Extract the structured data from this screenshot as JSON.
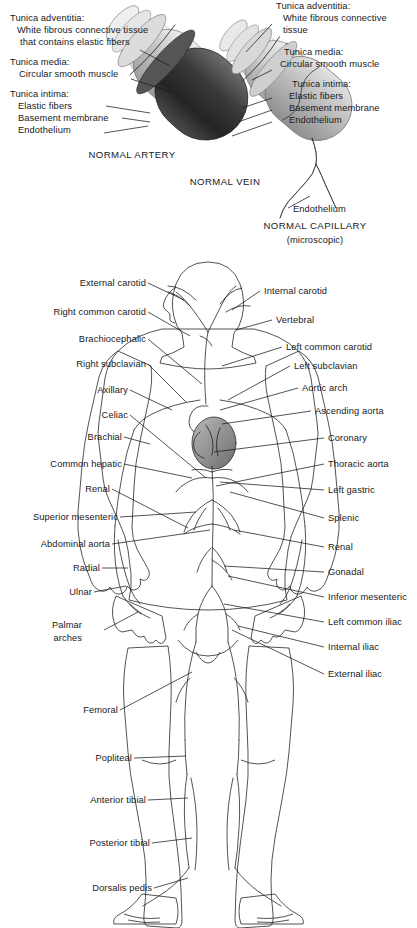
{
  "diagram": {
    "vessel_panel": {
      "artery": {
        "caption": "NORMAL ARTERY",
        "labels": [
          {
            "id": "tunica-adventitia",
            "lines": [
              "Tunica adventitia:",
              "White fibrous connective tissue",
              "that contains elastic fibers"
            ]
          },
          {
            "id": "tunica-media",
            "lines": [
              "Tunica media:",
              "Circular smooth muscle"
            ]
          },
          {
            "id": "tunica-intima",
            "lines": [
              "Tunica intima:"
            ]
          },
          {
            "id": "elastic-fibers",
            "lines": [
              "Elastic fibers"
            ]
          },
          {
            "id": "basement-membrane",
            "lines": [
              "Basement membrane"
            ]
          },
          {
            "id": "endothelium",
            "lines": [
              "Endothelium"
            ]
          }
        ]
      },
      "vein": {
        "caption": "NORMAL VEIN",
        "labels": [
          {
            "id": "tunica-adventitia",
            "lines": [
              "Tunica adventitia:",
              "White fibrous connective",
              "tissue"
            ]
          },
          {
            "id": "tunica-media",
            "lines": [
              "Tunica media:",
              "Circular smooth muscle"
            ]
          },
          {
            "id": "tunica-intima",
            "lines": [
              "Tunica intima:"
            ]
          },
          {
            "id": "elastic-fibers",
            "lines": [
              "Elastic fibers"
            ]
          },
          {
            "id": "basement-membrane",
            "lines": [
              "Basement membrane"
            ]
          },
          {
            "id": "endothelium",
            "lines": [
              "Endothelium"
            ]
          }
        ]
      },
      "capillary": {
        "caption": "NORMAL CAPILLARY",
        "subcaption": "(microscopic)",
        "labels": [
          {
            "id": "endothelium",
            "lines": [
              "Endothelium"
            ]
          }
        ]
      },
      "text": {
        "artery_adventitia_l1": "Tunica adventitia:",
        "artery_adventitia_l2": "White fibrous connective tissue",
        "artery_adventitia_l3": "that contains elastic fibers",
        "artery_media_l1": "Tunica media:",
        "artery_media_l2": "Circular smooth muscle",
        "artery_intima_l1": "Tunica intima:",
        "artery_elastic": "Elastic fibers",
        "artery_basement": "Basement membrane",
        "artery_endothelium": "Endothelium",
        "artery_caption": "NORMAL ARTERY",
        "vein_adventitia_l1": "Tunica adventitia:",
        "vein_adventitia_l2": "White fibrous connective",
        "vein_adventitia_l3": "tissue",
        "vein_media_l1": "Tunica media:",
        "vein_media_l2": "Circular smooth muscle",
        "vein_intima_l1": "Tunica intima:",
        "vein_elastic": "Elastic fibers",
        "vein_basement": "Basement membrane",
        "vein_endothelium": "Endothelium",
        "vein_caption": "NORMAL VEIN",
        "cap_endothelium": "Endothelium",
        "cap_caption": "NORMAL CAPILLARY",
        "cap_sub": "(microscopic)"
      }
    },
    "body_labels_left": [
      {
        "id": "external-carotid",
        "text": "External carotid",
        "x": 146,
        "y": 283
      },
      {
        "id": "right-common-carotid",
        "text": "Right common carotid",
        "x": 146,
        "y": 312
      },
      {
        "id": "brachiocephalic",
        "text": "Brachiocephalic",
        "x": 146,
        "y": 339
      },
      {
        "id": "right-subclavian",
        "text": "Right subclavian",
        "x": 146,
        "y": 364
      },
      {
        "id": "axillary",
        "text": "Axillary",
        "x": 128,
        "y": 390
      },
      {
        "id": "celiac",
        "text": "Celiac",
        "x": 128,
        "y": 415
      },
      {
        "id": "brachial",
        "text": "Brachial",
        "x": 122,
        "y": 437
      },
      {
        "id": "common-hepatic",
        "text": "Common hepatic",
        "x": 122,
        "y": 464
      },
      {
        "id": "renal-left",
        "text": "Renal",
        "x": 110,
        "y": 489
      },
      {
        "id": "superior-mesenteric",
        "text": "Superior mesenteric",
        "x": 118,
        "y": 517
      },
      {
        "id": "abdominal-aorta",
        "text": "Abdominal aorta",
        "x": 110,
        "y": 544
      },
      {
        "id": "radial",
        "text": "Radial",
        "x": 100,
        "y": 568
      },
      {
        "id": "ulnar",
        "text": "Ulnar",
        "x": 92,
        "y": 592
      },
      {
        "id": "femoral",
        "text": "Femoral",
        "x": 118,
        "y": 710
      },
      {
        "id": "popliteal",
        "text": "Popliteal",
        "x": 132,
        "y": 758
      },
      {
        "id": "anterior-tibial",
        "text": "Anterior tibial",
        "x": 146,
        "y": 800
      },
      {
        "id": "posterior-tibial",
        "text": "Posterior tibial",
        "x": 150,
        "y": 843
      },
      {
        "id": "dorsalis-pedis",
        "text": "Dorsalis pedis",
        "x": 152,
        "y": 888
      }
    ],
    "body_label_palmar": {
      "id": "palmar-arches",
      "line1": "Palmar",
      "line2": "arches",
      "x": 83,
      "y": 625
    },
    "body_labels_right": [
      {
        "id": "internal-carotid",
        "text": "Internal carotid",
        "x": 262,
        "y": 291
      },
      {
        "id": "vertebral",
        "text": "Vertebral",
        "x": 274,
        "y": 320
      },
      {
        "id": "left-common-carotid",
        "text": "Left common carotid",
        "x": 284,
        "y": 347
      },
      {
        "id": "left-subclavian",
        "text": "Left subclavian",
        "x": 292,
        "y": 366
      },
      {
        "id": "aortic-arch",
        "text": "Aortic arch",
        "x": 300,
        "y": 388
      },
      {
        "id": "ascending-aorta",
        "text": "Ascending aorta",
        "x": 313,
        "y": 411
      },
      {
        "id": "coronary",
        "text": "Coronary",
        "x": 326,
        "y": 438
      },
      {
        "id": "thoracic-aorta",
        "text": "Thoracic aorta",
        "x": 326,
        "y": 464
      },
      {
        "id": "left-gastric",
        "text": "Left gastric",
        "x": 326,
        "y": 490
      },
      {
        "id": "splenic",
        "text": "Splenic",
        "x": 326,
        "y": 518
      },
      {
        "id": "renal-right",
        "text": "Renal",
        "x": 326,
        "y": 547
      },
      {
        "id": "gonadal",
        "text": "Gonadal",
        "x": 326,
        "y": 572
      },
      {
        "id": "inferior-mesenteric",
        "text": "Inferior mesenteric",
        "x": 326,
        "y": 597
      },
      {
        "id": "left-common-iliac",
        "text": "Left common iliac",
        "x": 326,
        "y": 622
      },
      {
        "id": "internal-iliac",
        "text": "Internal iliac",
        "x": 326,
        "y": 647
      },
      {
        "id": "external-iliac",
        "text": "External iliac",
        "x": 326,
        "y": 674
      }
    ],
    "colors": {
      "ink": "#17191c",
      "skin_light": "#d9d9d9",
      "skin_mid": "#c2c2c2",
      "skin_dark": "#a8a8a8",
      "vessel_line": "#3a3a3a",
      "artery_dark": "#434343",
      "background": "#ffffff"
    }
  }
}
